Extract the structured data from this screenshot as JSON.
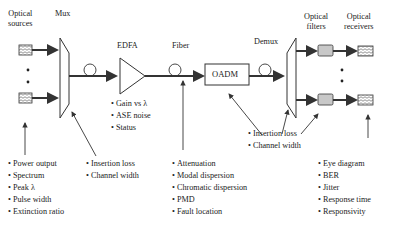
{
  "labels": {
    "optical_sources": "Optical\nsources",
    "mux": "Mux",
    "edfa": "EDFA",
    "fiber": "Fiber",
    "oadm": "OADM",
    "demux": "Demux",
    "optical_filters": "Optical\nfilters",
    "optical_receivers": "Optical\nreceivers"
  },
  "lists": {
    "sources": [
      "Power output",
      "Spectrum",
      "Peak λ",
      "Pulse width",
      "Extinction ratio"
    ],
    "mux": [
      "Insertion loss",
      "Channel width"
    ],
    "edfa": [
      "Gain vs λ",
      "ASE noise",
      "Status"
    ],
    "fiber": [
      "Attenuation",
      "Modal dispersion",
      "Chromatic dispersion",
      "PMD",
      "Fault location"
    ],
    "demux": [
      "Insertion loss",
      "Channel width"
    ],
    "receivers": [
      "Eye diagram",
      "BER",
      "Jitter",
      "Response time",
      "Responsivity"
    ]
  },
  "colors": {
    "line": "#333333",
    "filter_fill": "#c8c8c8",
    "background": "#ffffff"
  }
}
